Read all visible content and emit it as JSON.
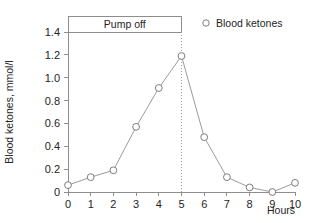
{
  "chart_data": {
    "type": "line",
    "title": "",
    "xlabel": "Hours",
    "ylabel": "Blood ketones, mmol/l",
    "x": [
      0,
      1,
      2,
      3,
      4,
      5,
      6,
      7,
      8,
      9,
      10
    ],
    "xticklabels": [
      "0",
      "1",
      "2",
      "3",
      "4",
      "5",
      "6",
      "7",
      "8",
      "9",
      "10"
    ],
    "xlim": [
      0,
      10
    ],
    "ylim": [
      0,
      1.4
    ],
    "yticks": [
      0,
      0.2,
      0.4,
      0.6,
      0.8,
      1.0,
      1.2,
      1.4
    ],
    "yticklabels": [
      "0",
      "0.2",
      "0.4",
      "0.6",
      "0.8",
      "1.0",
      "1.2",
      "1.4"
    ],
    "grid": false,
    "legend_position": "top-right",
    "series": [
      {
        "name": "Blood ketones",
        "marker": "open-circle",
        "color": "#9b9b9b",
        "values": [
          0.06,
          0.13,
          0.19,
          0.57,
          0.91,
          1.19,
          0.48,
          0.13,
          0.04,
          0.0,
          0.08
        ]
      }
    ],
    "annotations": [
      {
        "label": "Pump off",
        "type": "span-bracket",
        "x_start": 0,
        "x_end": 5
      }
    ]
  },
  "legend": {
    "entries": [
      {
        "label": "Blood ketones",
        "marker": "open-circle"
      }
    ]
  },
  "axes": {
    "x_title": "Hours",
    "y_title": "Blood ketones, mmol/l"
  },
  "colors": {
    "line": "#9b9b9b",
    "marker_stroke": "#7d7d7d",
    "axis": "#8d8d8d",
    "text": "#242424",
    "background": "#ffffff"
  }
}
